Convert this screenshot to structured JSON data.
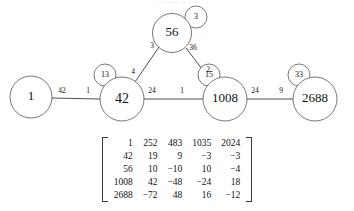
{
  "page": {
    "title_sliver": "·· ····· ·· ···",
    "background_color": "#ffffff",
    "node_stroke_color": "#555555",
    "edge_color": "#3a3a3a",
    "text_color": "#111111"
  },
  "graph": {
    "type": "node-link-diagram",
    "nodes": [
      {
        "id": "n1",
        "label": "1",
        "cx": 31,
        "cy": 97,
        "r": 21,
        "font_size": 13
      },
      {
        "id": "n42",
        "label": "42",
        "cx": 122,
        "cy": 99,
        "r": 22,
        "font_size": 14
      },
      {
        "id": "n56",
        "label": "56",
        "cx": 172,
        "cy": 33,
        "r": 19.5,
        "font_size": 13
      },
      {
        "id": "n1008",
        "label": "1008",
        "cx": 225,
        "cy": 99,
        "r": 22,
        "font_size": 13
      },
      {
        "id": "n2688",
        "label": "2688",
        "cx": 315,
        "cy": 99,
        "r": 22,
        "font_size": 13
      }
    ],
    "badges": [
      {
        "id": "b13",
        "label": "13",
        "cx": 105,
        "cy": 75,
        "r": 11,
        "attached_to": "n42"
      },
      {
        "id": "b3",
        "label": "3",
        "cx": 196,
        "cy": 17,
        "r": 11,
        "attached_to": "n56"
      },
      {
        "id": "b15",
        "label": "15",
        "cx": 209,
        "cy": 75,
        "r": 11,
        "attached_to": "n1008"
      },
      {
        "id": "b33",
        "label": "33",
        "cx": 299,
        "cy": 75,
        "r": 11,
        "attached_to": "n2688"
      }
    ],
    "edges": [
      {
        "id": "e-1-42",
        "from": "n1",
        "to": "n42",
        "x1": 52,
        "y1": 98,
        "x2": 100,
        "y2": 99,
        "labels": [
          {
            "text": "42",
            "x": 62,
            "y": 91
          },
          {
            "text": "1",
            "x": 88,
            "y": 91
          }
        ]
      },
      {
        "id": "e-42-56",
        "from": "n42",
        "to": "n56",
        "x1": 135,
        "y1": 82,
        "x2": 159,
        "y2": 47,
        "labels": [
          {
            "text": "4",
            "x": 133,
            "y": 72
          },
          {
            "text": "3",
            "x": 152,
            "y": 46
          }
        ]
      },
      {
        "id": "e-56-1008",
        "from": "n56",
        "to": "n1008",
        "x1": 186,
        "y1": 48,
        "x2": 212,
        "y2": 82,
        "labels": [
          {
            "text": "36",
            "x": 193,
            "y": 48
          },
          {
            "text": "2",
            "x": 208,
            "y": 70
          }
        ]
      },
      {
        "id": "e-42-1008",
        "from": "n42",
        "to": "n1008",
        "x1": 144,
        "y1": 99,
        "x2": 203,
        "y2": 99,
        "labels": [
          {
            "text": "24",
            "x": 152,
            "y": 91
          },
          {
            "text": "1",
            "x": 182,
            "y": 91
          }
        ]
      },
      {
        "id": "e-1008-2688",
        "from": "n1008",
        "to": "n2688",
        "x1": 247,
        "y1": 99,
        "x2": 293,
        "y2": 99,
        "labels": [
          {
            "text": "24",
            "x": 255,
            "y": 91
          },
          {
            "text": "9",
            "x": 281,
            "y": 91
          }
        ]
      }
    ]
  },
  "matrix": {
    "rows": [
      [
        "1",
        "252",
        "483",
        "1035",
        "2024"
      ],
      [
        "42",
        "19",
        "9",
        "−3",
        "−3"
      ],
      [
        "56",
        "10",
        "−10",
        "10",
        "−4"
      ],
      [
        "1008",
        "42",
        "−48",
        "−24",
        "18"
      ],
      [
        "2688",
        "−72",
        "48",
        "16",
        "−12"
      ]
    ]
  }
}
